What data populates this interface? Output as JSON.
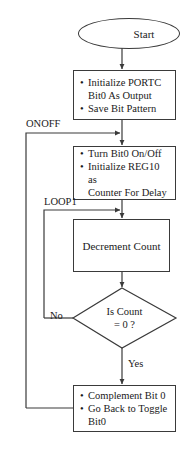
{
  "diagram": {
    "type": "flowchart",
    "title_text": "",
    "stroke_color": "#3a3a3a",
    "text_color": "#1a1a1a",
    "background_color": "#ffffff"
  },
  "nodes": {
    "start": {
      "shape": "terminal",
      "label": "Start"
    },
    "init": {
      "shape": "process",
      "items": [
        "Initialize PORTC\nBit0 As Output",
        "Save Bit Pattern"
      ]
    },
    "toggle": {
      "shape": "process",
      "items": [
        "Turn Bit0 On/Off",
        "Initialize REG10 as\nCounter For Delay"
      ]
    },
    "decrement": {
      "shape": "process",
      "label": "Decrement Count"
    },
    "decision": {
      "shape": "decision",
      "line1": "Is Count",
      "line2": "= 0 ?"
    },
    "complement": {
      "shape": "process",
      "items": [
        "Complement Bit 0",
        "Go Back to Toggle\nBit0"
      ]
    }
  },
  "connector_labels": {
    "onoff": "ONOFF",
    "loop1": "LOOP1",
    "no": "No",
    "yes": "Yes"
  }
}
